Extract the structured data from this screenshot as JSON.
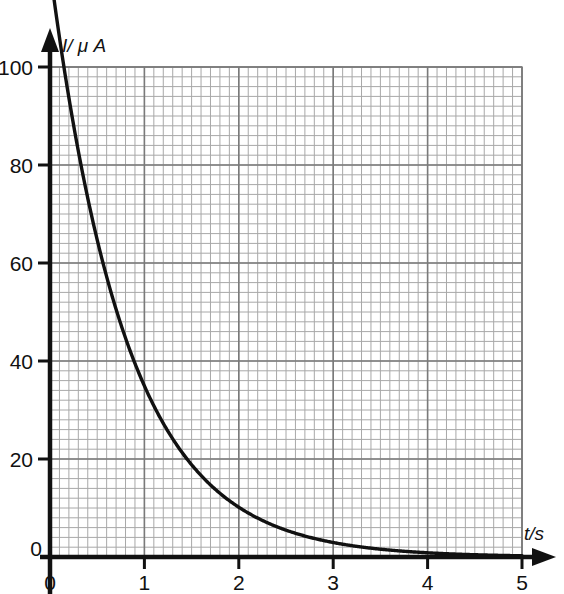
{
  "figure": {
    "background_color": "#ffffff",
    "curve_color": "#111111",
    "axis_color": "#111111",
    "grid_minor_color": "#a8a8a8",
    "grid_major_color": "#7a7a7a"
  },
  "chart_data": {
    "type": "line",
    "title": "",
    "subtitle": "",
    "xlabel": "t/s",
    "ylabel": "I/ μ A",
    "xlim": [
      0,
      5
    ],
    "ylim": [
      0,
      100
    ],
    "xticks": [
      "0",
      "1",
      "2",
      "3",
      "4",
      "5"
    ],
    "xtick_values": [
      0,
      1,
      2,
      3,
      4,
      5
    ],
    "yticks": [
      "0",
      "20",
      "40",
      "60",
      "80",
      "100"
    ],
    "ytick_values": [
      0,
      20,
      40,
      60,
      80,
      100
    ],
    "grid": true,
    "grid_minor_per_major_x": 10,
    "grid_minor_per_major_y": 10,
    "legend": null,
    "legend_position": "none",
    "annotations": [],
    "origin_label": "0",
    "series": [
      {
        "name": "Discharge current",
        "model": "exponential_decay",
        "equation": "I = 120 e^(-t/0.81)",
        "I0": 120,
        "tau": 0.81,
        "x": [
          0.0,
          0.1,
          0.2,
          0.3,
          0.4,
          0.5,
          0.6,
          0.7,
          0.8,
          0.9,
          1.0,
          1.2,
          1.4,
          1.6,
          1.8,
          2.0,
          2.2,
          2.4,
          2.6,
          2.8,
          3.0,
          3.2,
          3.4,
          3.6,
          3.8,
          4.0,
          4.2,
          4.4,
          4.6,
          4.8,
          5.0
        ],
        "y": [
          120.0,
          106.0,
          93.7,
          82.8,
          73.2,
          64.7,
          57.2,
          50.5,
          44.7,
          39.5,
          34.9,
          27.3,
          21.3,
          16.6,
          13.0,
          10.2,
          7.9,
          6.2,
          4.8,
          3.8,
          3.0,
          2.3,
          1.8,
          1.4,
          1.1,
          0.9,
          0.7,
          0.5,
          0.4,
          0.3,
          0.2
        ]
      }
    ]
  }
}
